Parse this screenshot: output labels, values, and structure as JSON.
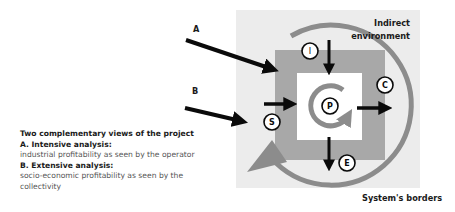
{
  "diagram": {
    "colors": {
      "indirect_environment_bg": "#ececec",
      "system_border_box": "#a8a8a8",
      "project_box": "#ffffff",
      "cycle_arc": "#8c8c8c",
      "arrows": "#0a0a0a"
    },
    "labels": {
      "indirect_line1": "Indirect",
      "indirect_line2": "environment",
      "system_borders": "System's borders",
      "arrow_a": "A",
      "arrow_b": "B"
    },
    "nodes": {
      "project": "P",
      "inputs": "I",
      "suppliers": "S",
      "customers": "C",
      "externalities": "E"
    }
  },
  "caption": {
    "heading": "Two complementary views of the project",
    "a_title": "A. Intensive analysis:",
    "a_desc": "industrial profitability as seen by the operator",
    "b_title": "B. Extensive analysis:",
    "b_desc_line1": "socio-economic profitability as seen by the",
    "b_desc_line2": "collectivity"
  }
}
